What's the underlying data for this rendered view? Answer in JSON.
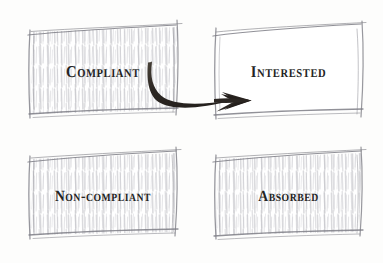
{
  "diagram": {
    "background_color": "#fdfdfc",
    "ink_color": "#242424",
    "pencil_color": "#8d8d93",
    "style": "hand-drawn pencil sketch with ink arrow"
  },
  "boxes": [
    {
      "id": "compliant",
      "label": "Compliant",
      "position": "top-left",
      "shaded": true,
      "x": 25,
      "y": 22,
      "width": 156,
      "height": 96
    },
    {
      "id": "interested",
      "label": "Interested",
      "position": "top-right",
      "shaded": false,
      "x": 211,
      "y": 22,
      "width": 155,
      "height": 96
    },
    {
      "id": "non-compliant",
      "label": "Non-compliant",
      "position": "bottom-left",
      "shaded": true,
      "x": 25,
      "y": 148,
      "width": 156,
      "height": 91
    },
    {
      "id": "absorbed",
      "label": "Absorbed",
      "position": "bottom-right",
      "shaded": true,
      "x": 211,
      "y": 148,
      "width": 155,
      "height": 91
    }
  ],
  "arrow": {
    "id": "compliant-to-interested",
    "from": "compliant",
    "to": "interested",
    "color": "#2b2622",
    "style": "curved tapered ink arrow with swept-back head",
    "start_x": 152,
    "start_y": 63,
    "end_x": 250,
    "end_y": 101
  }
}
